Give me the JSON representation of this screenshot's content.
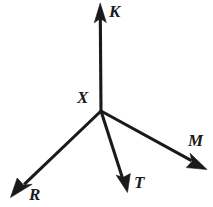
{
  "figure": {
    "name": "rays-from-common-endpoint-diagram",
    "background_color": "#ffffff",
    "stroke_color": "#1a1a1a",
    "vertex": {
      "label": "X",
      "x": 101,
      "y": 111
    },
    "rays": [
      {
        "id": "K",
        "label": "K",
        "from_x": 101,
        "from_y": 111,
        "to_x": 100,
        "to_y": 4,
        "label_x": 109,
        "label_y": 3,
        "direction": "up"
      },
      {
        "id": "M",
        "label": "M",
        "from_x": 101,
        "from_y": 111,
        "to_x": 207,
        "to_y": 169,
        "label_x": 188,
        "label_y": 132,
        "direction": "down-right"
      },
      {
        "id": "T",
        "label": "T",
        "from_x": 101,
        "from_y": 111,
        "to_x": 127,
        "to_y": 192,
        "label_x": 134,
        "label_y": 174,
        "direction": "down"
      },
      {
        "id": "R",
        "label": "R",
        "from_x": 101,
        "from_y": 111,
        "to_x": 11,
        "to_y": 197,
        "label_x": 29,
        "label_y": 186,
        "direction": "down-left"
      }
    ]
  }
}
